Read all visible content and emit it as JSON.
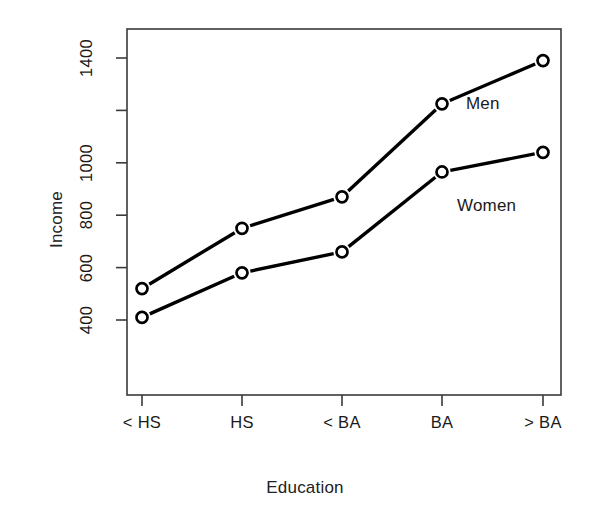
{
  "chart_data": {
    "type": "line",
    "title": "",
    "xlabel": "Education",
    "ylabel": "Income",
    "categories": [
      "< HS",
      "HS",
      "< BA",
      "BA",
      "> BA"
    ],
    "series": [
      {
        "name": "Men",
        "values": [
          520,
          750,
          870,
          1225,
          1390
        ]
      },
      {
        "name": "Women",
        "values": [
          410,
          580,
          660,
          965,
          1040
        ]
      }
    ],
    "ylim": [
      330,
      1450
    ],
    "ytick_values": [
      400,
      600,
      800,
      1000,
      1200,
      1400
    ],
    "ytick_labels": [
      "400",
      "600",
      "800",
      "1000",
      "1200",
      "1400"
    ],
    "ytick_labels_shown": [
      "400",
      "600",
      "800",
      "",
      "1000",
      "1400"
    ],
    "grid": false,
    "legend_position": "inline-right-of-last-points",
    "marker": "open-circle",
    "line_color": "#000000",
    "background_color": "#ffffff",
    "frame": true
  },
  "axes": {
    "y_title": "Income",
    "x_title": "Education"
  },
  "y_ticks": [
    {
      "label": "1400",
      "value": 1400,
      "labelled": true
    },
    {
      "label": "1200",
      "value": 1200,
      "labelled": false
    },
    {
      "label": "1000",
      "value": 1000,
      "labelled": true
    },
    {
      "label": "800",
      "value": 800,
      "labelled": true
    },
    {
      "label": "600",
      "value": 600,
      "labelled": true
    },
    {
      "label": "400",
      "value": 400,
      "labelled": true
    }
  ],
  "x_ticks": [
    {
      "label": "< HS"
    },
    {
      "label": "HS"
    },
    {
      "label": "< BA"
    },
    {
      "label": "BA"
    },
    {
      "label": "> BA"
    }
  ],
  "series_labels": [
    {
      "name": "Men"
    },
    {
      "name": "Women"
    }
  ]
}
